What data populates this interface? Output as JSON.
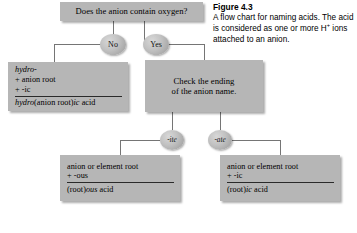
{
  "figure": {
    "caption_title": "Figure 4.3",
    "caption_part1": "A flow chart for naming acids. The acid is considered as one or more H",
    "caption_superscript": "+",
    "caption_part2": " ions attached to an anion."
  },
  "flowchart": {
    "question_box": {
      "text": "Does the anion contain oxygen?"
    },
    "branches": {
      "no_label": "No",
      "yes_label": "Yes",
      "ite_label": "-ite",
      "ate_label": "-ate"
    },
    "hydro_box": {
      "line1": "hydro-",
      "line2": "+ anion root",
      "line3": "+ -ic",
      "result_prefix": "hydro",
      "result_rest": "(anion root)",
      "result_ic": "ic",
      "result_acid": " acid"
    },
    "check_box": {
      "line1": "Check the ending",
      "line2": "of the anion name."
    },
    "ous_box": {
      "line1": "anion or element root",
      "line2": "+ -ous",
      "result_prefix": "(root)",
      "result_em": "ous",
      "result_acid": " acid"
    },
    "ic_box": {
      "line1": "anion or element root",
      "line2": "+ -ic",
      "result_prefix": "(root)",
      "result_em": "ic",
      "result_acid": " acid"
    }
  },
  "colors": {
    "box_fill": "#b6b6b6",
    "node_fill": "#bfbfbf",
    "line": "#6e6e6e",
    "text": "#000000",
    "background": "#ffffff"
  }
}
